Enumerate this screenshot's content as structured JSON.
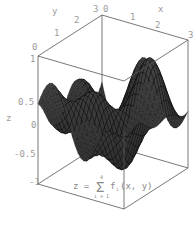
{
  "chart_data": {
    "type": "surface3d",
    "title": "",
    "formula": {
      "lhs": "z =",
      "sum_symbol": "Σ",
      "upper": "4",
      "lower": "i = 1",
      "term": "f",
      "subscript": "i",
      "args": "(x, y)"
    },
    "axes": {
      "x": {
        "label": "x",
        "range": [
          0,
          3
        ],
        "ticks": [
          "0",
          "1",
          "2",
          "3"
        ]
      },
      "y": {
        "label": "y",
        "range": [
          0,
          3
        ],
        "ticks": [
          "0",
          "1",
          "2",
          "3"
        ]
      },
      "z": {
        "label": "z",
        "range": [
          -1,
          1
        ],
        "ticks": [
          "-1",
          "-0.5",
          "0",
          "0.5",
          "1"
        ]
      }
    },
    "surface": {
      "description": "Oscillating saddle-like surface with sharp peaks reaching z=1 and troughs reaching z=-1 along the box edges",
      "color": "#2a2a2a",
      "mesh_color": "#000000",
      "grid": [
        30,
        30
      ]
    },
    "box_color": "#555555",
    "label_color": "#9a9a9a"
  }
}
